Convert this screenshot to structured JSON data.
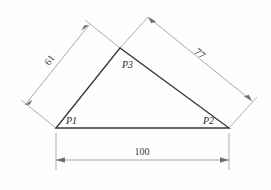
{
  "figure": {
    "background_color": "#fefefe",
    "line_color": "#3a3a3a",
    "dimension_color": "#8a8a8a",
    "text_color": "#2b2b2b"
  },
  "vertices": [
    {
      "id": "P1",
      "label": "P1",
      "x": 56,
      "y": 128,
      "label_x": 66,
      "label_y": 124
    },
    {
      "id": "P2",
      "label": "P2",
      "x": 229,
      "y": 128,
      "label_x": 205,
      "label_y": 124
    },
    {
      "id": "P3",
      "label": "P3",
      "x": 120,
      "y": 48,
      "label_x": 122,
      "label_y": 67
    }
  ],
  "dimensions": [
    {
      "id": "side-p1-p3",
      "label": "61",
      "value": 61,
      "edge_from": "P1",
      "edge_to": "P3",
      "rotation_deg": -61,
      "label_x": 52,
      "label_y": 62
    },
    {
      "id": "side-p3-p2",
      "label": "77",
      "value": 77,
      "edge_from": "P3",
      "edge_to": "P2",
      "rotation_deg": 33,
      "label_x": 196,
      "label_y": 55
    },
    {
      "id": "side-p1-p2",
      "label": "100",
      "value": 100,
      "edge_from": "P1",
      "edge_to": "P2",
      "rotation_deg": 0,
      "label_x": 142,
      "label_y": 155
    }
  ]
}
